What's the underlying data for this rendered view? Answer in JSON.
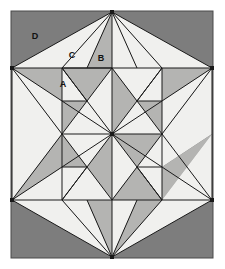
{
  "figure": {
    "frame": {
      "x": 11,
      "y": 11,
      "width": 202,
      "height": 247,
      "background_color": "#7d7d7d",
      "border_color": "#4a4a4a"
    },
    "colors": {
      "dark_gray": "#7d7d7d",
      "medium_gray": "#b4b4b2",
      "light_gray": "#f0f0ee",
      "stroke": "#1a1a1a",
      "label_text": "#111111",
      "page_background": "#ffffff"
    },
    "vertices": {
      "top": [
        112,
        12
      ],
      "left_upper": [
        12,
        68
      ],
      "right_upper": [
        212,
        68
      ],
      "left_lower": [
        12,
        200
      ],
      "right_lower": [
        212,
        200
      ],
      "bottom": [
        112,
        257
      ],
      "center": [
        112,
        134
      ],
      "mid_left_upper": [
        62,
        68
      ],
      "mid_right_upper": [
        162,
        68
      ],
      "mid_left_lower": [
        62,
        200
      ],
      "mid_right_lower": [
        162,
        200
      ],
      "left_mid": [
        62,
        134
      ],
      "right_mid": [
        162,
        134
      ]
    },
    "labels": [
      {
        "text": "D",
        "x": 35,
        "y": 37
      },
      {
        "text": "C",
        "x": 72,
        "y": 56
      },
      {
        "text": "B",
        "x": 101,
        "y": 59
      },
      {
        "text": "A",
        "x": 63,
        "y": 85
      }
    ],
    "polygons": [
      {
        "id": "upper-left-wing",
        "tone": "light",
        "points": "12,68 112,12 62,68"
      },
      {
        "id": "upper-mid-left",
        "tone": "light",
        "points": "62,68 112,12 87,68"
      },
      {
        "id": "upper-mid-right",
        "tone": "medium",
        "points": "87,68 112,12 112,68"
      },
      {
        "id": "upper-right-in",
        "tone": "light",
        "points": "112,68 112,12 137,68"
      },
      {
        "id": "upper-right-mid",
        "tone": "light",
        "points": "137,68 112,12 162,68"
      },
      {
        "id": "upper-right-wing",
        "tone": "light",
        "points": "162,68 112,12 212,68"
      },
      {
        "id": "ul-band-a",
        "tone": "medium",
        "points": "12,68 62,68 62,101"
      },
      {
        "id": "ul-band-b",
        "tone": "light",
        "points": "12,68 62,101 62,134"
      },
      {
        "id": "ul-band-c",
        "tone": "light",
        "points": "12,68 62,134 12,134"
      },
      {
        "id": "ul-tri-d",
        "tone": "medium",
        "points": "62,68 112,68 87,101"
      },
      {
        "id": "ul-tri-e",
        "tone": "light",
        "points": "62,68 87,101 62,101"
      },
      {
        "id": "ul-tri-f",
        "tone": "light",
        "points": "112,68 112,134 87,101"
      },
      {
        "id": "ul-tri-g",
        "tone": "medium",
        "points": "62,101 87,101 62,134"
      },
      {
        "id": "ul-tri-h",
        "tone": "light",
        "points": "87,101 112,134 62,134"
      },
      {
        "id": "ur-tri-a",
        "tone": "light",
        "points": "112,68 162,68 137,101"
      },
      {
        "id": "ur-tri-b",
        "tone": "medium",
        "points": "112,68 137,101 112,134"
      },
      {
        "id": "ur-tri-c",
        "tone": "light",
        "points": "162,68 162,101 137,101"
      },
      {
        "id": "ur-tri-d",
        "tone": "medium",
        "points": "137,101 162,101 162,134"
      },
      {
        "id": "ur-tri-e",
        "tone": "light",
        "points": "137,101 162,134 112,134"
      },
      {
        "id": "ur-band-a",
        "tone": "medium",
        "points": "162,68 212,68 162,101"
      },
      {
        "id": "ur-band-b",
        "tone": "light",
        "points": "212,68 162,101 162,134"
      },
      {
        "id": "ur-band-c",
        "tone": "light",
        "points": "212,68 162,134 212,134"
      },
      {
        "id": "ll-band-a",
        "tone": "light",
        "points": "12,134 62,134 12,200"
      },
      {
        "id": "ll-band-b",
        "tone": "medium",
        "points": "62,134 62,167 12,200"
      },
      {
        "id": "ll-band-c",
        "tone": "light",
        "points": "62,167 62,200 12,200"
      },
      {
        "id": "ll-tri-d",
        "tone": "light",
        "points": "62,134 112,134 87,167"
      },
      {
        "id": "ll-tri-e",
        "tone": "medium",
        "points": "62,134 87,167 62,167"
      },
      {
        "id": "ll-tri-f",
        "tone": "medium",
        "points": "112,134 112,200 87,167"
      },
      {
        "id": "ll-tri-g",
        "tone": "light",
        "points": "62,167 87,167 62,200"
      },
      {
        "id": "ll-tri-h",
        "tone": "light",
        "points": "87,167 112,200 62,200"
      },
      {
        "id": "lr-tri-a",
        "tone": "medium",
        "points": "112,134 162,134 137,167"
      },
      {
        "id": "lr-tri-b",
        "tone": "light",
        "points": "112,134 137,167 112,200"
      },
      {
        "id": "lr-tri-c",
        "tone": "light",
        "points": "162,134 162,167 137,167"
      },
      {
        "id": "lr-tri-d",
        "tone": "light",
        "points": "137,167 162,167 162,200"
      },
      {
        "id": "lr-tri-e",
        "tone": "medium",
        "points": "137,167 162,200 112,200"
      },
      {
        "id": "lr-band-a",
        "tone": "light",
        "points": "162,134 212,134 162,167"
      },
      {
        "id": "lr-band-b",
        "tone": "medium",
        "points": "212,134 162,167 162,200"
      },
      {
        "id": "lr-band-c",
        "tone": "light",
        "points": "212,134 162,200 212,200"
      },
      {
        "id": "lower-left-wing",
        "tone": "light",
        "points": "12,200 62,200 112,257"
      },
      {
        "id": "lower-mid-left",
        "tone": "light",
        "points": "62,200 87,200 112,257"
      },
      {
        "id": "lower-mid-left2",
        "tone": "medium",
        "points": "87,200 112,200 112,257"
      },
      {
        "id": "lower-mid-right",
        "tone": "light",
        "points": "112,200 137,200 112,257"
      },
      {
        "id": "lower-right-mid",
        "tone": "medium",
        "points": "137,200 162,200 112,257"
      },
      {
        "id": "lower-right-wing",
        "tone": "light",
        "points": "162,200 212,200 112,257"
      }
    ],
    "lines": [
      "12,68 212,68",
      "62,134 162,134",
      "12,200 212,200",
      "112,12 112,257",
      "12,68 112,12",
      "112,12 212,68",
      "12,200 112,257",
      "112,257 212,200",
      "12,68 12,200",
      "212,68 212,200",
      "12,68 112,134",
      "112,134 212,68",
      "12,200 112,134",
      "112,134 212,200",
      "62,68 62,200",
      "162,68 162,200",
      "112,12 62,68",
      "112,12 162,68",
      "112,257 62,200",
      "112,257 162,200",
      "62,68 112,134",
      "112,134 162,68",
      "62,200 112,134",
      "112,134 162,200",
      "12,68 62,134",
      "62,134 12,200",
      "212,68 162,134",
      "162,134 212,200",
      "62,68 112,68",
      "62,101 87,101",
      "137,101 162,101",
      "62,167 87,167",
      "137,167 162,167",
      "112,68 87,101",
      "62,68 87,101",
      "112,68 137,101",
      "162,68 137,101",
      "112,200 87,167",
      "62,200 87,167",
      "112,200 137,167",
      "162,200 137,167",
      "87,101 62,134",
      "137,101 162,134",
      "87,167 62,134",
      "137,167 162,134",
      "87,68 112,12",
      "137,68 112,12",
      "87,200 112,257",
      "137,200 112,257"
    ],
    "vertex_dots": [
      [
        112,
        12
      ],
      [
        12,
        68
      ],
      [
        212,
        68
      ],
      [
        12,
        200
      ],
      [
        212,
        200
      ],
      [
        112,
        257
      ],
      [
        112,
        134
      ]
    ]
  }
}
